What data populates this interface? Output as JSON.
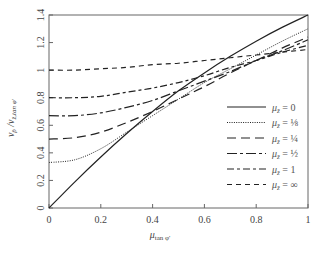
{
  "chart_data": {
    "type": "line",
    "title": "",
    "xlabel": "μ_tan φ'",
    "ylabel": "v_p̄ / v_z,tan φ'",
    "xlim": [
      0,
      1
    ],
    "ylim": [
      0,
      1.4
    ],
    "grid": false,
    "legend_position": "lower right (inside)",
    "x_ticks": [
      "0",
      "0.2",
      "0.4",
      "0.6",
      "0.8",
      "1"
    ],
    "y_ticks": [
      "0",
      "0.2",
      "0.4",
      "0.6",
      "0.8",
      "1",
      "1.2",
      "1.4"
    ],
    "x": [
      0,
      0.1,
      0.2,
      0.3,
      0.4,
      0.5,
      0.6,
      0.7,
      0.8,
      0.9,
      1.0
    ],
    "series": [
      {
        "name": "μ_z̄ = 0",
        "style": "solid",
        "values": [
          0.0,
          0.19,
          0.37,
          0.54,
          0.7,
          0.85,
          0.98,
          1.1,
          1.21,
          1.31,
          1.4
        ]
      },
      {
        "name": "μ_z̄ = ⅛",
        "style": "dotted",
        "values": [
          0.33,
          0.35,
          0.43,
          0.55,
          0.67,
          0.79,
          0.91,
          1.01,
          1.11,
          1.21,
          1.3
        ]
      },
      {
        "name": "μ_z̄ = ¼",
        "style": "long-dash",
        "values": [
          0.5,
          0.51,
          0.55,
          0.62,
          0.7,
          0.79,
          0.88,
          0.98,
          1.07,
          1.16,
          1.24
        ]
      },
      {
        "name": "μ_z̄ = ½",
        "style": "dash-dot",
        "values": [
          0.67,
          0.67,
          0.69,
          0.73,
          0.78,
          0.85,
          0.92,
          0.99,
          1.07,
          1.14,
          1.22
        ]
      },
      {
        "name": "μ_z̄ = 1",
        "style": "dash-dot-long",
        "values": [
          0.8,
          0.8,
          0.81,
          0.84,
          0.87,
          0.91,
          0.96,
          1.02,
          1.07,
          1.13,
          1.18
        ]
      },
      {
        "name": "μ_z̄ = ∞",
        "style": "dashed",
        "values": [
          1.0,
          1.0,
          1.01,
          1.02,
          1.04,
          1.05,
          1.07,
          1.09,
          1.11,
          1.13,
          1.15
        ]
      }
    ]
  },
  "axes": {
    "xlabel_main": "μ",
    "xlabel_sub": "tan φ'",
    "ylabel_main": "v",
    "ylabel_sub1": "p̄",
    "ylabel_slash": " /v",
    "ylabel_sub2": "z̄,tan φ'"
  },
  "legend": [
    {
      "label": "μ_z̄ = 0"
    },
    {
      "label": "μ_z̄ = ⅛"
    },
    {
      "label": "μ_z̄ = ¼"
    },
    {
      "label": "μ_z̄ = ½"
    },
    {
      "label": "μ_z̄ = 1"
    },
    {
      "label": "μ_z̄ = ∞"
    }
  ],
  "legend_values": [
    "0",
    "⅛",
    "¼",
    "½",
    "1",
    "∞"
  ],
  "colors": {
    "line": "#222222",
    "axis": "#555555",
    "text": "#444444"
  }
}
